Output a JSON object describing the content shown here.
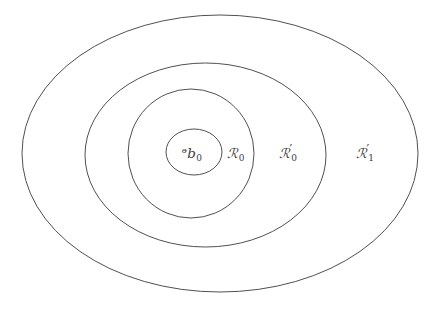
{
  "figure": {
    "type": "nested-region-diagram",
    "background_color": "#ffffff",
    "stroke_color": "#3c3c3c",
    "stroke_width": 0.9,
    "width": 439,
    "height": 310,
    "shapes": [
      {
        "name": "outer-ellipse",
        "label_key": "r1_prime",
        "cx": 220,
        "cy": 153.5,
        "rx": 198,
        "ry": 138.5
      },
      {
        "name": "second-ellipse",
        "label_key": "r0_prime",
        "cx": 205.5,
        "cy": 155,
        "rx": 120.5,
        "ry": 92
      },
      {
        "name": "third-ellipse",
        "label_key": "r0",
        "cx": 191,
        "cy": 153.5,
        "rx": 63,
        "ry": 64.5
      },
      {
        "name": "inner-circle",
        "label_key": "p0",
        "cx": 194,
        "cy": 152,
        "rx": 28,
        "ry": 23
      }
    ],
    "labels": [
      {
        "key": "p0",
        "name": "label-p0",
        "letter": "ᵊb",
        "base": "P",
        "subscript": "0",
        "prime": "",
        "x": 192,
        "y": 154
      },
      {
        "key": "r0",
        "name": "label-r0",
        "letter": "ℛ",
        "base": "R",
        "subscript": "0",
        "prime": "",
        "x": 236,
        "y": 154
      },
      {
        "key": "r0_prime",
        "name": "label-r0-prime",
        "letter": "ℛ",
        "base": "R",
        "subscript": "0",
        "prime": "′",
        "x": 288,
        "y": 153
      },
      {
        "key": "r1_prime",
        "name": "label-r1-prime",
        "letter": "ℛ",
        "base": "R",
        "subscript": "1",
        "prime": "′",
        "x": 365,
        "y": 153
      }
    ]
  }
}
